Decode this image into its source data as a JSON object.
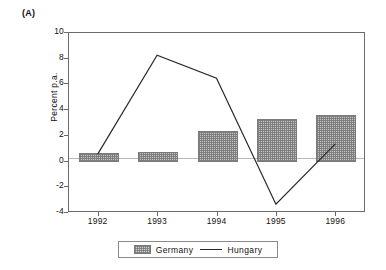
{
  "figure": {
    "panel_label": "(A)"
  },
  "chart_data": {
    "type": "bar",
    "title": "(A)",
    "xlabel": "",
    "ylabel": "Percent p.a.",
    "categories": [
      "1992",
      "1993",
      "1994",
      "1995",
      "1996"
    ],
    "ylim": [
      -4,
      10
    ],
    "yticks": [
      "10",
      "8",
      "6",
      "4",
      "2",
      "0",
      "-2",
      "-4"
    ],
    "ytick_values": [
      10,
      8,
      6,
      4,
      2,
      0,
      -2,
      -4
    ],
    "grid": false,
    "legend_position": "bottom",
    "series": [
      {
        "name": "Germany",
        "render": "bar",
        "pattern": "cross-hatch",
        "color": "#c3c3c3",
        "values": [
          0.65,
          0.75,
          2.4,
          3.3,
          3.6
        ]
      },
      {
        "name": "Hungary",
        "render": "line",
        "color": "#2a2a2a",
        "values": [
          0.5,
          8.2,
          6.4,
          -3.4,
          1.3
        ]
      }
    ]
  },
  "legend": {
    "items": [
      {
        "label": "Germany",
        "marker": "swatch"
      },
      {
        "label": "Hungary",
        "marker": "line"
      }
    ]
  }
}
